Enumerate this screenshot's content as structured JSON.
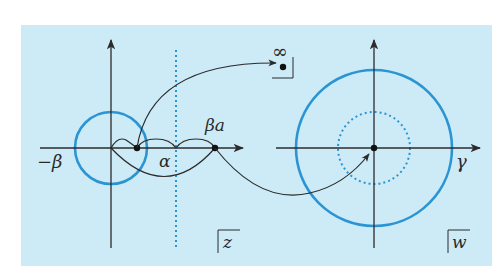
{
  "colors": {
    "panel_bg": "#cdeaf7",
    "page_bg": "#ffffff",
    "axis": "#2b2b2b",
    "circle": "#2b95d3",
    "curve": "#2b2b2b",
    "point": "#111111"
  },
  "z_plane": {
    "label": "z",
    "labels": {
      "minus_beta": "−β",
      "alpha": "α",
      "beta_a": "βa"
    }
  },
  "w_plane": {
    "label": "w",
    "labels": {
      "gamma": "γ"
    }
  },
  "infinity": {
    "label": "∞"
  }
}
